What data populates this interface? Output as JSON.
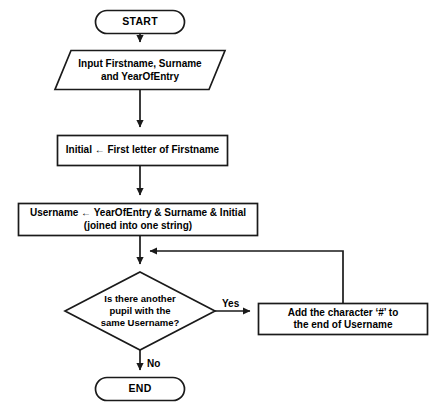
{
  "diagram": {
    "type": "flowchart",
    "background_color": "#ffffff",
    "line_color": "#1a1a1a",
    "text_color": "#000000",
    "nodes": [
      {
        "id": "start",
        "shape": "terminator",
        "label": "START"
      },
      {
        "id": "input",
        "shape": "parallelogram",
        "label": "Input Firstname, Surname\nand YearOfEntry"
      },
      {
        "id": "initial",
        "shape": "process",
        "label": "Initial ← First letter of Firstname"
      },
      {
        "id": "username",
        "shape": "process",
        "label": "Username ← YearOfEntry & Surname & Initial\n(joined into one string)"
      },
      {
        "id": "decision",
        "shape": "diamond",
        "label": "Is there another\npupil with the\nsame Username?"
      },
      {
        "id": "append",
        "shape": "process",
        "label": "Add the character ‘#’ to\nthe end of Username"
      },
      {
        "id": "end",
        "shape": "terminator",
        "label": "END"
      }
    ],
    "edge_labels": {
      "yes": "Yes",
      "no": "No"
    }
  }
}
